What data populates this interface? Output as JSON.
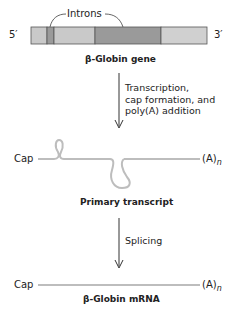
{
  "gene": {
    "title": "β-Globin gene",
    "five_prime": "5′",
    "three_prime": "3′",
    "introns_label": "Introns",
    "segments": [
      {
        "type": "exon",
        "x": 31,
        "w": 16,
        "color": "#c9c9c9"
      },
      {
        "type": "intron",
        "x": 47,
        "w": 7,
        "color": "#9a9a9a"
      },
      {
        "type": "exon",
        "x": 54,
        "w": 41,
        "color": "#c9c9c9"
      },
      {
        "type": "intron",
        "x": 95,
        "w": 66,
        "color": "#9a9a9a"
      },
      {
        "type": "exon",
        "x": 161,
        "w": 46,
        "color": "#d0d0d0"
      }
    ]
  },
  "step1": {
    "lines": [
      "Transcription,",
      "cap formation, and",
      "poly(A) addition"
    ]
  },
  "primary_transcript": {
    "title": "Primary transcript",
    "cap": "Cap",
    "tail": "(A)",
    "tail_sub": "n"
  },
  "step2": {
    "label": "Splicing"
  },
  "mrna": {
    "title": "β-Globin mRNA",
    "cap": "Cap",
    "tail": "(A)",
    "tail_sub": "n"
  }
}
